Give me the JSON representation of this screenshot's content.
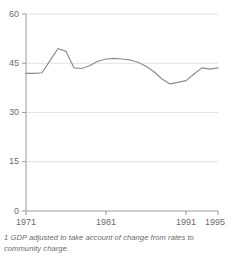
{
  "figure": {
    "footnote": "1 GDP adjusted to take account of change from rates to community charge.",
    "clipped_header": "",
    "colors": {
      "line": "#8c8c8c",
      "axis": "#9a9a9a",
      "grid": "#e2e2e2",
      "text": "#6b6b6b",
      "background": "#ffffff"
    }
  },
  "chart_data": {
    "type": "line",
    "title": "",
    "subtitle": "",
    "xlabel": "",
    "ylabel": "",
    "xlim": [
      1971,
      1995
    ],
    "ylim": [
      0,
      60
    ],
    "grid": true,
    "legend": null,
    "x_ticks": [
      1971,
      1981,
      1991,
      1995
    ],
    "x_tick_labels": [
      "1971",
      "1981",
      "1991",
      "1995"
    ],
    "y_ticks": [
      0,
      15,
      30,
      45,
      60
    ],
    "y_tick_labels": [
      "0",
      "15",
      "30",
      "45",
      "60"
    ],
    "series": [
      {
        "name": "General government expenditure as a percentage of GDP",
        "color": "#8c8c8c",
        "x": [
          1971,
          1972,
          1973,
          1974,
          1975,
          1976,
          1977,
          1978,
          1979,
          1980,
          1981,
          1982,
          1983,
          1984,
          1985,
          1986,
          1987,
          1988,
          1989,
          1990,
          1991,
          1992,
          1993,
          1994,
          1995
        ],
        "values": [
          41.9,
          41.9,
          42.1,
          45.8,
          49.5,
          48.6,
          43.6,
          43.4,
          44.3,
          45.6,
          46.3,
          46.5,
          46.3,
          46.0,
          45.3,
          44.1,
          42.4,
          40.2,
          38.7,
          39.2,
          39.7,
          41.7,
          43.6,
          43.2,
          43.6
        ]
      }
    ],
    "annotations": [
      {
        "text": "1 GDP adjusted to take account of change from rates to community charge.",
        "type": "footnote"
      }
    ]
  }
}
